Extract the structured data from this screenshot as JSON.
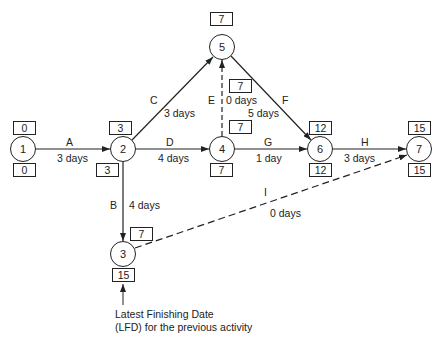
{
  "diagram": {
    "type": "activity-on-arrow network (CPM)",
    "nodes": [
      {
        "id": "1",
        "label": "1",
        "top_box": "0",
        "bottom_box": "0"
      },
      {
        "id": "2",
        "label": "2",
        "top_box": "3",
        "bottom_box": "3"
      },
      {
        "id": "3",
        "label": "3",
        "top_box": "7",
        "bottom_box": "15"
      },
      {
        "id": "4",
        "label": "4",
        "top_box": "7",
        "bottom_box": "7"
      },
      {
        "id": "5",
        "label": "5",
        "top_box": "7",
        "mid_box": "7"
      },
      {
        "id": "6",
        "label": "6",
        "top_box": "12",
        "bottom_box": "12"
      },
      {
        "id": "7",
        "label": "7",
        "top_box": "15",
        "bottom_box": "15"
      }
    ],
    "activities": [
      {
        "name": "A",
        "from": "1",
        "to": "2",
        "duration": "3 days",
        "style": "solid"
      },
      {
        "name": "B",
        "from": "2",
        "to": "3",
        "duration": "4 days",
        "style": "solid"
      },
      {
        "name": "C",
        "from": "2",
        "to": "5",
        "duration": "3 days",
        "style": "solid"
      },
      {
        "name": "D",
        "from": "2",
        "to": "4",
        "duration": "4 days",
        "style": "solid"
      },
      {
        "name": "E",
        "from": "4",
        "to": "5",
        "duration": "0 days",
        "style": "dashed"
      },
      {
        "name": "F",
        "from": "5",
        "to": "6",
        "duration": "5 days",
        "style": "solid"
      },
      {
        "name": "G",
        "from": "4",
        "to": "6",
        "duration": "1 day",
        "style": "solid"
      },
      {
        "name": "H",
        "from": "6",
        "to": "7",
        "duration": "3 days",
        "style": "solid"
      },
      {
        "name": "I",
        "from": "3",
        "to": "7",
        "duration": "0 days",
        "style": "dashed"
      }
    ],
    "annotation": {
      "line1": "Latest Finishing Date",
      "line2": "(LFD) for the previous activity"
    }
  }
}
